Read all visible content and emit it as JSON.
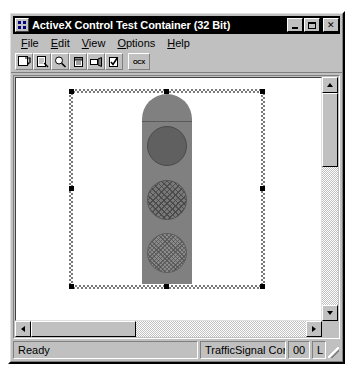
{
  "window": {
    "title": "ActiveX Control Test Container (32 Bit)",
    "icon": "activex-container-icon",
    "caption_buttons": [
      {
        "name": "minimize",
        "label": "_"
      },
      {
        "name": "maximize",
        "label": "□"
      },
      {
        "name": "close",
        "label": "×"
      }
    ]
  },
  "menu": {
    "items": [
      {
        "label": "File",
        "pre": "",
        "accel": "F",
        "post": "ile"
      },
      {
        "label": "Edit",
        "pre": "",
        "accel": "E",
        "post": "dit"
      },
      {
        "label": "View",
        "pre": "",
        "accel": "V",
        "post": "iew"
      },
      {
        "label": "Options",
        "pre": "",
        "accel": "O",
        "post": "ptions"
      },
      {
        "label": "Help",
        "pre": "",
        "accel": "H",
        "post": "elp"
      }
    ]
  },
  "toolbar": {
    "buttons": [
      {
        "name": "new-control",
        "icon": "insert-control-icon",
        "tooltip": "New Control"
      },
      {
        "name": "insert-new-control",
        "icon": "new-document-icon",
        "tooltip": "Insert New Control"
      },
      {
        "name": "properties",
        "icon": "magnifier-icon",
        "tooltip": "Properties"
      },
      {
        "name": "invoke-methods",
        "icon": "container-icon",
        "tooltip": "Invoke Methods"
      },
      {
        "name": "event-log",
        "icon": "log-icon",
        "tooltip": "Event Log"
      },
      {
        "name": "control-info",
        "icon": "checkmark-box-icon",
        "tooltip": "Control Information"
      }
    ],
    "ocx_button": {
      "name": "ocx-button",
      "label": "OCX",
      "tooltip": "OCX"
    }
  },
  "canvas": {
    "control": {
      "name": "TrafficSignal Control",
      "selected": true,
      "handles": [
        "nw",
        "n",
        "ne",
        "w",
        "e",
        "sw",
        "s",
        "se"
      ],
      "lamps": [
        {
          "name": "red-lamp",
          "position": "top",
          "state": "on"
        },
        {
          "name": "yellow-lamp",
          "position": "middle",
          "state": "dim"
        },
        {
          "name": "green-lamp",
          "position": "bottom",
          "state": "off"
        }
      ]
    }
  },
  "scrollbars": {
    "vertical": {
      "up": "▲",
      "down": "▼"
    },
    "horizontal": {
      "left": "◄",
      "right": "►"
    }
  },
  "status_bar": {
    "message": "Ready",
    "control_pane": "TrafficSignal Con",
    "count_pane": "00",
    "extra_pane": "L"
  },
  "colors": {
    "face": "#c0c0c0",
    "title_bar": "#000000",
    "title_text": "#ffffff",
    "canvas": "#ffffff",
    "signal_body": "#808080",
    "lamp_on": "#606060",
    "lamp_dim": "#787878",
    "lamp_off": "#8a8a8a",
    "handle": "#000000"
  }
}
